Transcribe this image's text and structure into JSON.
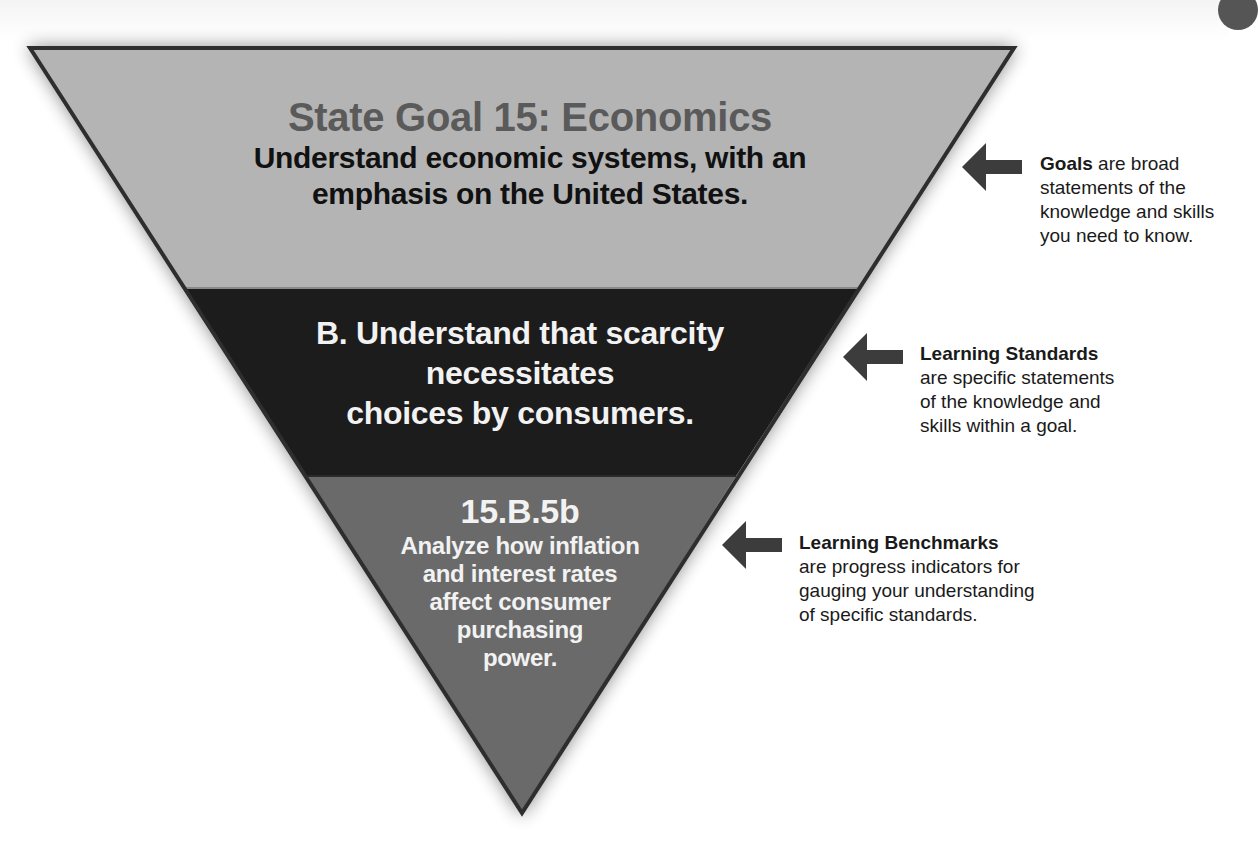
{
  "colors": {
    "goal_band": "#b4b4b4",
    "standard_band": "#1c1c1c",
    "benchmark_band": "#6a6a6a",
    "outline": "#2e2e2e",
    "arrow": "#3c3c3c"
  },
  "pyramid": {
    "goal": {
      "title": "State Goal 15: Economics",
      "description": "Understand economic systems, with an emphasis on the United States.",
      "description_lines": [
        "Understand economic systems, with an",
        "emphasis on the United States."
      ]
    },
    "standard": {
      "lines": [
        "B. Understand that scarcity",
        "necessitates",
        "choices by consumers."
      ]
    },
    "benchmark": {
      "code": "15.B.5b",
      "lines": [
        "Analyze how inflation",
        "and interest rates",
        "affect consumer",
        "purchasing",
        "power."
      ]
    }
  },
  "callouts": [
    {
      "term": "Goals",
      "icon": "arrow-left-icon",
      "text_after_term": " are broad",
      "lines": [
        "statements of the",
        "knowledge and skills",
        "you need to know."
      ]
    },
    {
      "term": "Learning Standards",
      "icon": "arrow-left-icon",
      "lines": [
        "are specific statements",
        "of the knowledge and",
        "skills within a goal."
      ]
    },
    {
      "term": "Learning Benchmarks",
      "icon": "arrow-left-icon",
      "lines": [
        "are progress indicators for",
        "gauging your understanding",
        "of specific standards."
      ]
    }
  ]
}
